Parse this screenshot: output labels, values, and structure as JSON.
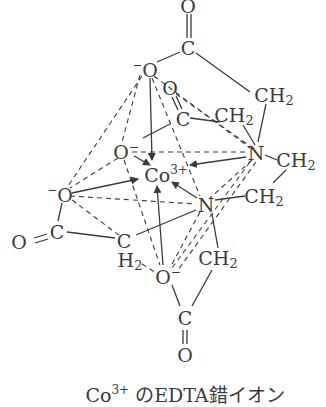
{
  "diagram": {
    "caption": {
      "prefix": "Co",
      "charge": "3+",
      "suffix": " のEDTA錯イオン"
    },
    "center_ion": {
      "symbol": "Co",
      "charge": "3+"
    },
    "atoms": {
      "o_top": "O",
      "c_top": "C",
      "o_upper_left_charge": "−",
      "o_upper_left": "O",
      "ch2_upper_right": "CH",
      "o_inner": "O",
      "c_inner": "C",
      "ch2_inner": "CH",
      "o_left_inner": "O",
      "o_left_inner_charge": "−",
      "n_upper": "N",
      "ch2_right_upper": "CH",
      "o_left_outer_charge": "−",
      "o_left_outer": "O",
      "n_lower": "N",
      "ch2_right_lower": "CH",
      "o_far_left": "O",
      "c_left": "C",
      "c_lower_mid": "C",
      "h2_lower_mid": "H",
      "o_bottom_inner": "O",
      "o_bottom_inner_charge": "−",
      "ch2_bottom_right": "CH",
      "c_bottom": "C",
      "o_bottom": "O",
      "sub2": "2"
    },
    "colors": {
      "ink": "#3a3a3a",
      "background": "#ffffff"
    }
  }
}
